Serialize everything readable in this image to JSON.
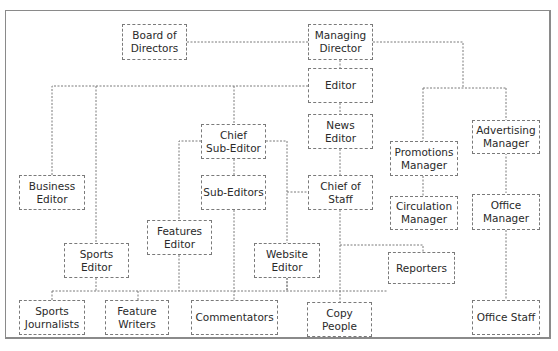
{
  "diagram": {
    "type": "organization-chart",
    "line_style": "dotted",
    "line_color": "#7a7a7a",
    "nodes": [
      {
        "id": "board",
        "label": "Board of\nDirectors"
      },
      {
        "id": "md",
        "label": "Managing\nDirector"
      },
      {
        "id": "editor",
        "label": "Editor"
      },
      {
        "id": "chief_sub",
        "label": "Chief\nSub-Editor"
      },
      {
        "id": "news_editor",
        "label": "News\nEditor"
      },
      {
        "id": "promotions",
        "label": "Promotions\nManager"
      },
      {
        "id": "advertising",
        "label": "Advertising\nManager"
      },
      {
        "id": "business",
        "label": "Business\nEditor"
      },
      {
        "id": "sub_editors",
        "label": "Sub-Editors"
      },
      {
        "id": "chief_staff",
        "label": "Chief of\nStaff"
      },
      {
        "id": "circulation",
        "label": "Circulation\nManager"
      },
      {
        "id": "office_manager",
        "label": "Office\nManager"
      },
      {
        "id": "features_editor",
        "label": "Features\nEditor"
      },
      {
        "id": "sports_editor",
        "label": "Sports\nEditor"
      },
      {
        "id": "website_editor",
        "label": "Website\nEditor"
      },
      {
        "id": "reporters",
        "label": "Reporters"
      },
      {
        "id": "sports_journalists",
        "label": "Sports\nJournalists"
      },
      {
        "id": "feature_writers",
        "label": "Feature\nWriters"
      },
      {
        "id": "commentators",
        "label": "Commentators"
      },
      {
        "id": "copy_people",
        "label": "Copy\nPeople"
      },
      {
        "id": "office_staff",
        "label": "Office Staff"
      }
    ],
    "edges": [
      [
        "board",
        "md"
      ],
      [
        "md",
        "editor"
      ],
      [
        "md",
        "promotions"
      ],
      [
        "md",
        "advertising"
      ],
      [
        "editor",
        "business"
      ],
      [
        "editor",
        "sports_editor"
      ],
      [
        "editor",
        "chief_sub"
      ],
      [
        "editor",
        "news_editor"
      ],
      [
        "chief_sub",
        "sub_editors"
      ],
      [
        "chief_sub",
        "features_editor"
      ],
      [
        "chief_sub",
        "chief_staff"
      ],
      [
        "news_editor",
        "chief_staff"
      ],
      [
        "chief_staff",
        "website_editor"
      ],
      [
        "chief_staff",
        "reporters"
      ],
      [
        "chief_staff",
        "copy_people"
      ],
      [
        "sub_editors",
        "commentators"
      ],
      [
        "features_editor",
        "feature_writers"
      ],
      [
        "sports_editor",
        "sports_journalists"
      ],
      [
        "promotions",
        "circulation"
      ],
      [
        "advertising",
        "office_manager"
      ],
      [
        "office_manager",
        "office_staff"
      ]
    ]
  }
}
